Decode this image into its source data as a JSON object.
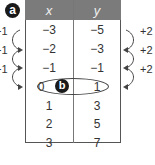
{
  "labels": {
    "a": "a",
    "b": "b"
  },
  "table": {
    "headers": [
      "x",
      "y"
    ],
    "rows": [
      {
        "x": "−3",
        "y": "−5"
      },
      {
        "x": "−2",
        "y": "−3"
      },
      {
        "x": "−1",
        "y": "−1"
      },
      {
        "x": "0",
        "y": "1"
      },
      {
        "x": "1",
        "y": "3"
      },
      {
        "x": "2",
        "y": "5"
      },
      {
        "x": "3",
        "y": "7"
      }
    ]
  },
  "left_increments": [
    "+1",
    "+1",
    "+1"
  ],
  "right_increments": [
    "+2",
    "+2",
    "+2"
  ],
  "highlighted_row": 3
}
